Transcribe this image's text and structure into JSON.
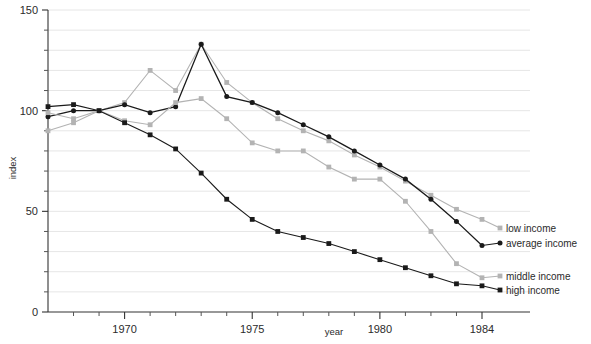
{
  "chart_data": {
    "type": "line",
    "title": "",
    "xlabel": "year",
    "ylabel": "index",
    "xlim": [
      1967,
      1984
    ],
    "ylim": [
      0,
      150
    ],
    "grid": true,
    "grid_step": 10,
    "legend_position": "right-inline",
    "x_ticks_major": [
      1970,
      1975,
      1980,
      1984
    ],
    "x_tick_labels": [
      "1970",
      "1975",
      "1980",
      "1984"
    ],
    "x_ticks_minor": [
      1968,
      1969,
      1971,
      1972,
      1973,
      1974,
      1976,
      1977,
      1978,
      1979,
      1981,
      1982,
      1983
    ],
    "y_ticks_major": [
      0,
      50,
      100,
      150
    ],
    "y_tick_labels": [
      "0",
      "50",
      "100",
      "150"
    ],
    "y_ticks_minor": [
      10,
      20,
      30,
      40,
      60,
      70,
      80,
      90,
      110,
      120,
      130,
      140
    ],
    "x": [
      1967,
      1968,
      1969,
      1970,
      1971,
      1972,
      1973,
      1974,
      1975,
      1976,
      1977,
      1978,
      1979,
      1980,
      1981,
      1982,
      1983,
      1984
    ],
    "series": [
      {
        "name": "low income",
        "color": "#b3b3b3",
        "marker": "square",
        "values": [
          90,
          94,
          100,
          104,
          120,
          110,
          133,
          114,
          104,
          96,
          90,
          85,
          78,
          72,
          65,
          58,
          51,
          46
        ]
      },
      {
        "name": "average income",
        "color": "#1a1a1a",
        "marker": "circle",
        "values": [
          97,
          100,
          100,
          103,
          99,
          102,
          133,
          107,
          104,
          99,
          93,
          87,
          80,
          73,
          66,
          56,
          45,
          33
        ]
      },
      {
        "name": "middle income",
        "color": "#b3b3b3",
        "marker": "square",
        "values": [
          99,
          96,
          100,
          95,
          93,
          104,
          106,
          96,
          84,
          80,
          80,
          72,
          66,
          66,
          55,
          40,
          24,
          17
        ]
      },
      {
        "name": "high income",
        "color": "#1a1a1a",
        "marker": "square",
        "values": [
          102,
          103,
          100,
          94,
          88,
          81,
          69,
          56,
          46,
          40,
          37,
          34,
          30,
          26,
          22,
          18,
          14,
          13
        ]
      }
    ],
    "legend": [
      {
        "label": "low income",
        "color": "#b3b3b3"
      },
      {
        "label": "average income",
        "color": "#1a1a1a"
      },
      {
        "label": "middle income",
        "color": "#b3b3b3"
      },
      {
        "label": "high income",
        "color": "#1a1a1a"
      }
    ]
  }
}
